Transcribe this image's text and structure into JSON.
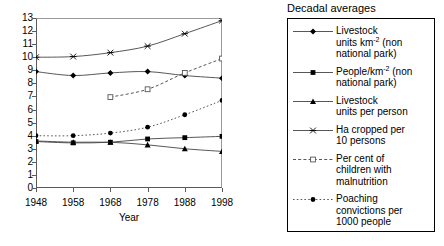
{
  "chart_data": {
    "type": "line",
    "title": "",
    "xlabel": "Year",
    "ylabel": "",
    "x": [
      1948,
      1958,
      1968,
      1978,
      1988,
      1998
    ],
    "categories": [
      "1948",
      "1958",
      "1968",
      "1978",
      "1988",
      "1998"
    ],
    "xticklabels": [
      "1948",
      "1958",
      "1968",
      "1978",
      "1988",
      "1998"
    ],
    "yticklabels": [
      "0",
      "1",
      "2",
      "3",
      "4",
      "5",
      "6",
      "7",
      "8",
      "9",
      "10",
      "11",
      "12",
      "13"
    ],
    "ylim": [
      0,
      13
    ],
    "xlim": [
      1948,
      1998
    ],
    "grid": false,
    "legend_position": "right",
    "legend_title": "Decadal averages",
    "series": [
      {
        "name": "Livestock units km-2 (non national park)",
        "marker": "diamond",
        "linestyle": "solid",
        "x": [
          1948,
          1958,
          1968,
          1978,
          1988,
          1998
        ],
        "values": [
          8.9,
          8.6,
          8.8,
          8.9,
          8.6,
          8.4
        ]
      },
      {
        "name": "People/km-2 (non national park)",
        "marker": "square",
        "linestyle": "solid",
        "x": [
          1948,
          1958,
          1968,
          1978,
          1988,
          1998
        ],
        "values": [
          3.55,
          3.45,
          3.5,
          3.75,
          3.85,
          3.95
        ]
      },
      {
        "name": "Livestock units per person",
        "marker": "triangle",
        "linestyle": "solid",
        "x": [
          1948,
          1958,
          1968,
          1978,
          1988,
          1998
        ],
        "values": [
          3.6,
          3.5,
          3.5,
          3.3,
          3.0,
          2.8
        ]
      },
      {
        "name": "Ha cropped per 10 persons",
        "marker": "cross",
        "linestyle": "solid",
        "x": [
          1948,
          1958,
          1968,
          1978,
          1988,
          1998
        ],
        "values": [
          10.0,
          10.05,
          10.35,
          10.85,
          11.8,
          12.8
        ]
      },
      {
        "name": "Per cent of children with malnutrition",
        "marker": "open-square",
        "linestyle": "dashed",
        "x": [
          1968,
          1978,
          1988,
          1998
        ],
        "values": [
          6.95,
          7.55,
          8.8,
          9.9
        ]
      },
      {
        "name": "Poaching convictions per 1000 people",
        "marker": "circle",
        "linestyle": "dotted",
        "x": [
          1948,
          1958,
          1968,
          1978,
          1988,
          1998
        ],
        "values": [
          4.0,
          4.0,
          4.2,
          4.65,
          5.6,
          6.7
        ]
      }
    ]
  },
  "legend": {
    "title": "Decadal averages",
    "items": [
      {
        "key": "livestock-units-per-km2",
        "line1": "Livestock",
        "line2_pre": "units km",
        "line2_sup": "-2",
        "line2_post": " (non",
        "line3": "national park)"
      },
      {
        "key": "people-per-km2",
        "line1_pre": "People/km",
        "line1_sup": "-2",
        "line1_post": " (non",
        "line2": "national park)"
      },
      {
        "key": "livestock-units-per-person",
        "line1": "Livestock",
        "line2": "units per person"
      },
      {
        "key": "ha-cropped-per-10-persons",
        "line1": "Ha cropped per",
        "line2": "10 persons"
      },
      {
        "key": "per-cent-children-malnutrition",
        "line1": "Per cent of",
        "line2": "children with",
        "line3": "malnutrition"
      },
      {
        "key": "poaching-convictions",
        "line1": "Poaching",
        "line2": "convictions per",
        "line3": "1000 people"
      }
    ]
  },
  "axes": {
    "xlabel": "Year"
  }
}
